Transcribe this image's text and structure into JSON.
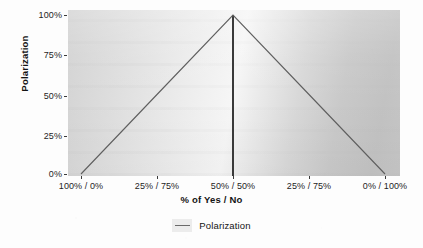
{
  "chart_data": {
    "type": "line",
    "title": "",
    "subtitle": "",
    "xlabel": "% of Yes / No",
    "ylabel": "Polarization",
    "x": [
      0,
      25,
      50,
      75,
      100
    ],
    "categories": [
      "100% / 0%",
      "25% / 75%",
      "50% / 50%",
      "25% / 75%",
      "0% / 100%"
    ],
    "series": [
      {
        "name": "Polarization",
        "values": [
          0,
          50,
          100,
          50,
          0
        ],
        "color": "#5f5f5f"
      }
    ],
    "xtick_labels": [
      "100% / 0%",
      "25% / 75%",
      "50% / 50%",
      "25% / 75%",
      "0% / 100%"
    ],
    "ytick_labels": [
      "100%",
      "75%",
      "50%",
      "25%",
      "0%"
    ],
    "ytick_values": [
      100,
      75,
      50,
      25,
      0
    ],
    "ylim": [
      0,
      100
    ],
    "xlim": [
      0,
      100
    ],
    "grid": false,
    "legend_position": "bottom",
    "legend_entries": [
      "Polarization"
    ],
    "annotations": [
      {
        "type": "vertical-reference-line",
        "x": 50,
        "label": "50% / 50%",
        "color": "#3a3a3a"
      }
    ],
    "panel_background": "#e4e4e4",
    "axis_text_color": "#1d1d1d"
  },
  "axes": {
    "y_title": "Polarization",
    "x_title": "% of Yes / No",
    "y_ticks": [
      {
        "label": "100%",
        "value": 100
      },
      {
        "label": "75%",
        "value": 75
      },
      {
        "label": "50%",
        "value": 50
      },
      {
        "label": "25%",
        "value": 25
      },
      {
        "label": "0%",
        "value": 0
      }
    ],
    "x_ticks": [
      {
        "label": "100% / 0%",
        "value": 0
      },
      {
        "label": "25% / 75%",
        "value": 25
      },
      {
        "label": "50% / 50%",
        "value": 50
      },
      {
        "label": "25% / 75%",
        "value": 75
      },
      {
        "label": "0% / 100%",
        "value": 100
      }
    ]
  },
  "legend": {
    "label": "Polarization"
  }
}
